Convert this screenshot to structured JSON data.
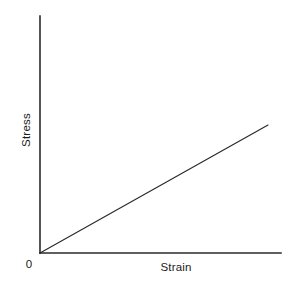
{
  "figure": {
    "width": 300,
    "height": 289,
    "background_color": "#ffffff",
    "line_color": "#2a2a2a",
    "text_color": "#1c1c1c"
  },
  "labels": {
    "origin": "0",
    "xlabel": "Strain",
    "ylabel": "Stress"
  },
  "chart_data": {
    "type": "line",
    "title": "",
    "subtitle": "",
    "xlabel": "Strain",
    "ylabel": "Stress",
    "origin_label": "0",
    "x": [
      0,
      1
    ],
    "y": [
      0,
      1
    ],
    "series": [
      {
        "name": "Linear elastic region (Hooke's law)",
        "x": [
          0,
          1
        ],
        "y": [
          0,
          1
        ],
        "color": "#2a2a2a",
        "linewidth": 1,
        "style": "solid"
      }
    ],
    "xlim": [
      0,
      1.06
    ],
    "ylim": [
      0,
      1
    ],
    "grid": false,
    "legend": false,
    "legend_position": "none",
    "xticks": [],
    "yticks": [],
    "xticklabels": [],
    "yticklabels": [],
    "annotations": []
  },
  "geometry": {
    "y_axis": {
      "x": 40,
      "y_top": 16,
      "y_bottom": 253
    },
    "x_axis": {
      "y": 253,
      "x_left": 40,
      "x_right": 281
    },
    "data_line": {
      "x1": 40,
      "y1": 253,
      "x2": 268,
      "y2": 125
    }
  }
}
